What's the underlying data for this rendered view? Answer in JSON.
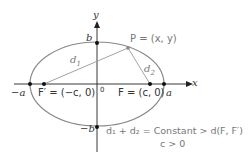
{
  "diagram": {
    "axis_x_label": "x",
    "axis_y_label": "y",
    "origin_label": "0",
    "vertex_b": "b",
    "vertex_neg_b": "−b",
    "vertex_a": "a",
    "vertex_neg_a": "−a",
    "focus_left": "F′ = (−c, 0)",
    "focus_right": "F = (c, 0)",
    "point_p": "P = (x, y)",
    "d1": "d",
    "d1_sub": "1",
    "d2": "d",
    "d2_sub": "2",
    "equation": "d₁ + d₂ = Constant > d(F, F′)",
    "condition": "c > 0",
    "colors": {
      "curve": "#888888",
      "axis": "#222222",
      "segment": "#999999",
      "text_gray": "#777777"
    }
  }
}
